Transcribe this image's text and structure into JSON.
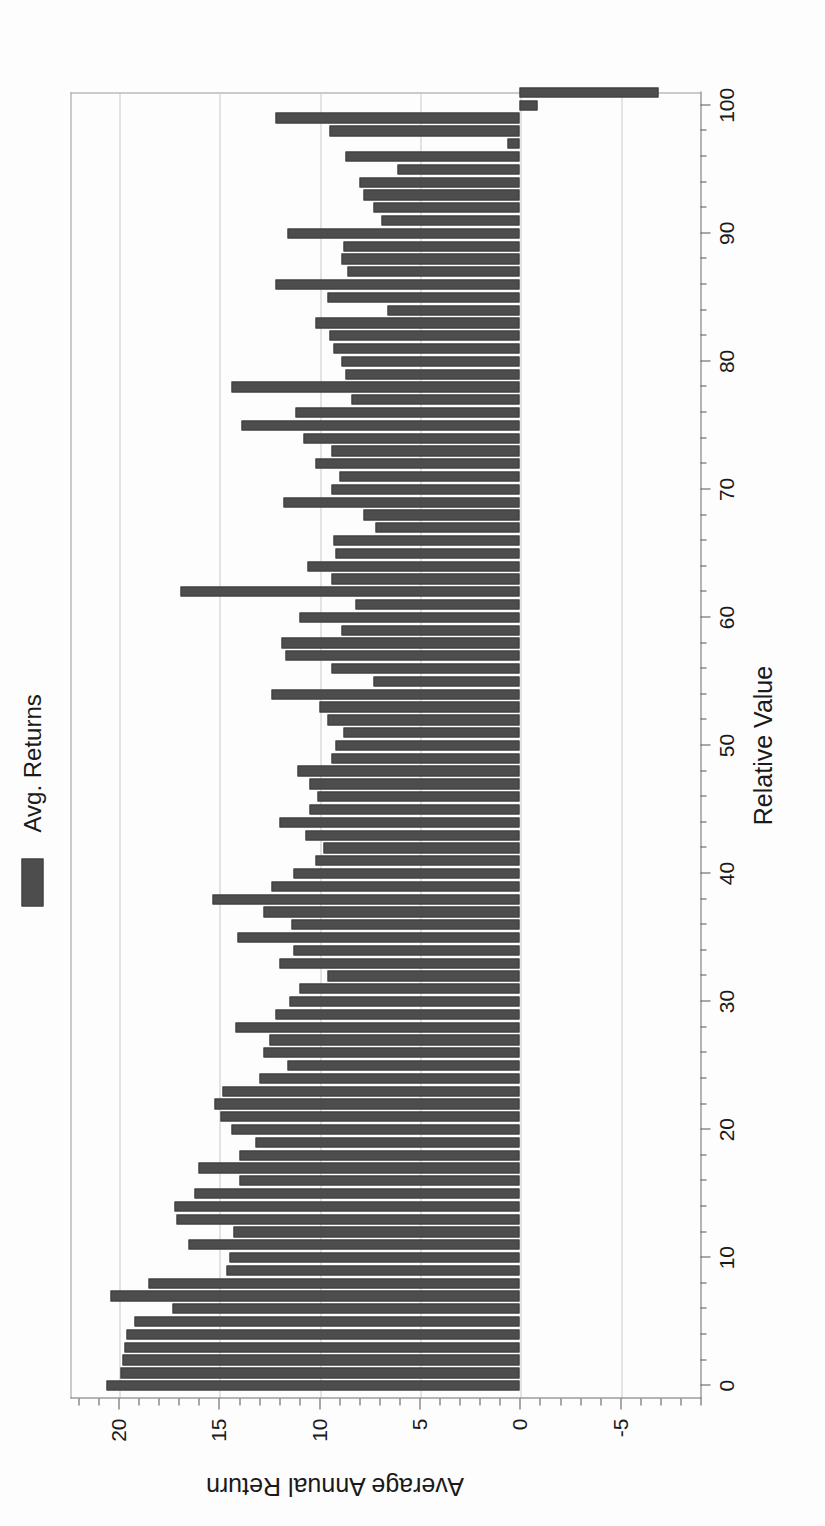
{
  "chart_data": {
    "type": "bar",
    "title": "",
    "subtitle": "",
    "xlabel": "Relative Value",
    "ylabel": "Average Annual Return",
    "xlim": [
      -1,
      101
    ],
    "ylim": [
      -9,
      22.4
    ],
    "xticks": [
      0,
      10,
      20,
      30,
      40,
      50,
      60,
      70,
      80,
      90,
      100
    ],
    "xticklabels": [
      "0",
      "10",
      "20",
      "30",
      "40",
      "50",
      "60",
      "70",
      "80",
      "90",
      "100"
    ],
    "x_minor_tick_step": 2,
    "yticks": [
      -5,
      0,
      5,
      10,
      15,
      20
    ],
    "yticklabels": [
      "-5",
      "0",
      "5",
      "10",
      "15",
      "20"
    ],
    "y_minor_tick_step": 1,
    "grid": "y-gridlines only (horizontal, at -5, 0, 5, 10, 15, 20)",
    "orientation": "vertical bars, chart rendered rotated 90 degrees on the page",
    "bar_color": "#4d4d4d",
    "legend": {
      "position": "top-right above plot",
      "entries": [
        {
          "label": "Avg. Returns",
          "color": "#4d4d4d"
        }
      ]
    },
    "series": [
      {
        "name": "Avg. Returns",
        "values": [
          20.6,
          19.9,
          19.8,
          19.7,
          19.6,
          19.2,
          17.3,
          20.4,
          18.5,
          14.6,
          14.5,
          16.5,
          14.3,
          17.1,
          17.2,
          16.2,
          14.0,
          16.0,
          14.0,
          13.2,
          14.4,
          14.9,
          15.2,
          14.8,
          13.0,
          11.6,
          12.8,
          12.5,
          14.2,
          12.2,
          11.5,
          11.0,
          9.6,
          12.0,
          11.3,
          14.1,
          11.4,
          12.8,
          15.3,
          12.4,
          11.3,
          10.2,
          9.8,
          10.7,
          12.0,
          10.5,
          10.1,
          10.5,
          11.1,
          9.4,
          9.2,
          8.8,
          9.6,
          10.0,
          12.4,
          7.3,
          9.4,
          11.7,
          11.9,
          8.9,
          11.0,
          8.2,
          16.9,
          9.4,
          10.6,
          9.2,
          9.3,
          7.2,
          7.8,
          11.8,
          9.4,
          9.0,
          10.2,
          9.4,
          10.8,
          13.9,
          11.2,
          8.4,
          14.4,
          8.7,
          8.9,
          9.3,
          9.5,
          10.2,
          6.6,
          9.6,
          12.2,
          8.6,
          8.9,
          8.8,
          11.6,
          6.9,
          7.3,
          7.8,
          8.0,
          6.1,
          8.7,
          0.6,
          9.5,
          12.2,
          -0.9,
          -6.9
        ]
      }
    ],
    "x": [
      0,
      1,
      2,
      3,
      4,
      5,
      6,
      7,
      8,
      9,
      10,
      11,
      12,
      13,
      14,
      15,
      16,
      17,
      18,
      19,
      20,
      21,
      22,
      23,
      24,
      25,
      26,
      27,
      28,
      29,
      30,
      31,
      32,
      33,
      34,
      35,
      36,
      37,
      38,
      39,
      40,
      41,
      42,
      43,
      44,
      45,
      46,
      47,
      48,
      49,
      50,
      51,
      52,
      53,
      54,
      55,
      56,
      57,
      58,
      59,
      60,
      61,
      62,
      63,
      64,
      65,
      66,
      67,
      68,
      69,
      70,
      71,
      72,
      73,
      74,
      75,
      76,
      77,
      78,
      79,
      80,
      81,
      82,
      83,
      84,
      85,
      86,
      87,
      88,
      89,
      90,
      91,
      92,
      93,
      94,
      95,
      96,
      97,
      98,
      99,
      100,
      101
    ]
  }
}
